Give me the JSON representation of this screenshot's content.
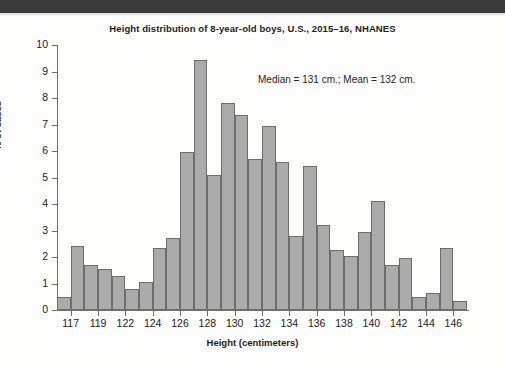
{
  "figure": {
    "title": "Height distribution of 8-year-old boys, U.S., 2015–16, NHANES",
    "annotation": "Median = 131 cm.; Mean = 132 cm.",
    "accent_color": "#ababab",
    "outline_color": "#6d6d6d",
    "axis_color": "#6f6f6f",
    "background_color": "#fdfdfb",
    "band_color": "#3b3b3b"
  },
  "chart_data": {
    "type": "bar",
    "title": "Height distribution of 8-year-old boys, U.S., 2015–16, NHANES",
    "xlabel": "Height (centimeters)",
    "ylabel": "% of cases",
    "ylim": [
      0,
      10
    ],
    "ytick_labels": [
      "0",
      "1",
      "2",
      "3",
      "4",
      "5",
      "6",
      "7",
      "8",
      "9",
      "10"
    ],
    "ytick_values": [
      0,
      1,
      2,
      3,
      4,
      5,
      6,
      7,
      8,
      9,
      10
    ],
    "xtick_labels": [
      "117",
      "119",
      "122",
      "124",
      "126",
      "128",
      "130",
      "132",
      "134",
      "136",
      "138",
      "140",
      "142",
      "144",
      "146"
    ],
    "grid": false,
    "legend": "none",
    "bin_width_cm": 1,
    "bin_centers": [
      116.5,
      117.5,
      118.5,
      119.5,
      120.5,
      121.5,
      122.5,
      123.5,
      124.5,
      125.5,
      126.5,
      127.5,
      128.5,
      129.5,
      130.5,
      131.5,
      132.5,
      133.5,
      134.5,
      135.5,
      136.5,
      137.5,
      138.5,
      139.5,
      140.5,
      141.5,
      142.5,
      143.5,
      144.5,
      145.5,
      146.5
    ],
    "values": [
      0.5,
      2.4,
      1.7,
      1.55,
      1.3,
      0.8,
      1.05,
      2.35,
      2.7,
      5.95,
      9.45,
      5.1,
      7.8,
      7.35,
      5.7,
      6.95,
      5.6,
      2.8,
      5.45,
      3.2,
      2.25,
      2.05,
      2.95,
      4.1,
      1.7,
      1.95,
      0.5,
      0.65,
      2.35,
      0.35
    ],
    "annotations": [
      "Median = 131 cm.; Mean = 132 cm."
    ],
    "statistics": {
      "median_cm": 131,
      "mean_cm": 132
    }
  }
}
